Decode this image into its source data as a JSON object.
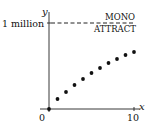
{
  "chart_data": {
    "type": "scatter",
    "title": "",
    "xlabel": "x",
    "ylabel": "y",
    "x_ticks": [
      "0",
      "10"
    ],
    "y_ticks": [
      "1 million"
    ],
    "xlim": [
      0,
      10
    ],
    "ylim": [
      0,
      1000000
    ],
    "grid": false,
    "annotations": [
      {
        "type": "hline",
        "y": 1000000,
        "style": "dashed",
        "label_top": "MONO",
        "label_bottom": "ATTRACT"
      }
    ],
    "series": [
      {
        "name": "points",
        "x": [
          0,
          1,
          2,
          3,
          4,
          5,
          6,
          7,
          8,
          9,
          10
        ],
        "y": [
          0,
          116000,
          198000,
          279000,
          349000,
          419000,
          477000,
          535000,
          581000,
          628000,
          663000
        ]
      }
    ]
  },
  "labels": {
    "y_axis": "y",
    "x_axis": "x",
    "y_tick": "1 million",
    "x_tick_0": "0",
    "x_tick_10": "10",
    "line_top": "MONO",
    "line_bottom": "ATTRACT"
  }
}
